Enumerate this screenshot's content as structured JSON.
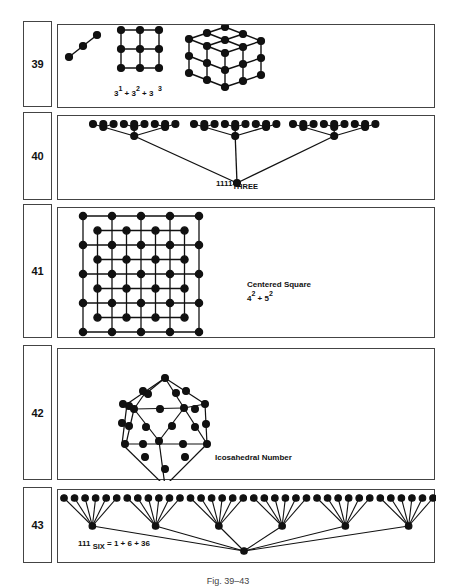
{
  "figures": [
    {
      "number": "39",
      "expression": {
        "b1": "3",
        "e1": "1",
        "op1": "+",
        "b2": "3",
        "e2": "2",
        "op2": "+",
        "b3": "3",
        "e3": "3"
      },
      "drawings": [
        "line of 3 points",
        "3x3 square grid",
        "3x3x3 cube"
      ]
    },
    {
      "number": "40",
      "label": {
        "value": "1111",
        "base": "THREE"
      },
      "drawings": [
        "ternary tree: 1 root, 3 nodes, 9 nodes, 27 leaves"
      ]
    },
    {
      "number": "41",
      "title": "Centered  Square",
      "expression": {
        "b1": "4",
        "e1": "2",
        "op": "+",
        "b2": "5",
        "e2": "2"
      },
      "drawings": [
        "5x5 grid interleaved with 4x4 grid"
      ]
    },
    {
      "number": "42",
      "title": "Icosahedral  Number",
      "drawings": [
        "icosahedron point figure"
      ]
    },
    {
      "number": "43",
      "label": {
        "value": "111",
        "base": "SIX",
        "rest": "= 1 + 6 + 36"
      },
      "drawings": [
        "senary tree: 1 root, 6 nodes, 36 leaves"
      ]
    }
  ],
  "caption": "Fig. 39–43"
}
